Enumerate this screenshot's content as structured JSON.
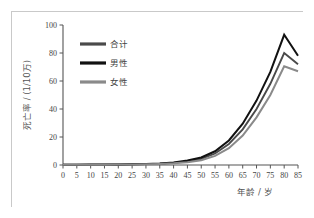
{
  "figure": {
    "background_color": "#ffffff",
    "frame_color": "#c9c9c9"
  },
  "chart_data": {
    "type": "line",
    "title": "",
    "xlabel": "年龄 / 岁",
    "ylabel": "死亡率 / (1/10万)",
    "x": [
      0,
      5,
      10,
      15,
      20,
      25,
      30,
      35,
      40,
      45,
      50,
      55,
      60,
      65,
      70,
      75,
      80,
      85
    ],
    "xlim": [
      0,
      85
    ],
    "ylim": [
      0,
      100
    ],
    "xticks": [
      "0",
      "5",
      "10",
      "15",
      "20",
      "25",
      "30",
      "35",
      "40",
      "45",
      "50",
      "55",
      "60",
      "65",
      "70",
      "75",
      "80",
      "85"
    ],
    "yticks": [
      "0",
      "20",
      "40",
      "60",
      "80",
      "100"
    ],
    "grid": false,
    "legend_position": "upper-left",
    "series": [
      {
        "name": "合计",
        "color": "#4a4a4a",
        "width": 1.9,
        "values": [
          0.2,
          0.2,
          0.2,
          0.3,
          0.4,
          0.5,
          0.6,
          0.9,
          1.5,
          2.6,
          4.4,
          8.2,
          15.0,
          25.5,
          40.0,
          58.0,
          80.0,
          72.0
        ]
      },
      {
        "name": "男性",
        "color": "#111111",
        "width": 2.0,
        "values": [
          0.2,
          0.2,
          0.3,
          0.3,
          0.4,
          0.6,
          0.7,
          1.0,
          1.8,
          3.2,
          5.4,
          9.8,
          17.5,
          29.5,
          46.0,
          66.5,
          93.0,
          78.0
        ]
      },
      {
        "name": "女性",
        "color": "#8a8a8a",
        "width": 2.0,
        "values": [
          0.2,
          0.2,
          0.2,
          0.2,
          0.3,
          0.4,
          0.5,
          0.8,
          1.2,
          2.0,
          3.4,
          6.5,
          12.0,
          21.0,
          34.0,
          50.0,
          70.5,
          67.0
        ]
      }
    ]
  },
  "legend": {
    "items": [
      {
        "label": "合计",
        "color": "#4a4a4a"
      },
      {
        "label": "男性",
        "color": "#111111"
      },
      {
        "label": "女性",
        "color": "#8a8a8a"
      }
    ]
  }
}
